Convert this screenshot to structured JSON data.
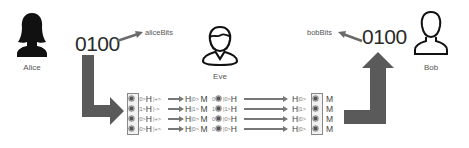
{
  "actors": {
    "alice": {
      "label": "Alice",
      "icon": "female-silhouette-filled-icon"
    },
    "eve": {
      "label": "Eve",
      "icon": "person-outline-icon"
    },
    "bob": {
      "label": "Bob",
      "icon": "person-outline-icon"
    }
  },
  "alice_bits": {
    "value": "0100",
    "label": "aliceBits"
  },
  "bob_bits": {
    "value": "0100",
    "label": "bobBits"
  },
  "colors": {
    "arrow": "#5a5a5a",
    "text": "#333333",
    "box_border": "#888888"
  },
  "circuit": {
    "rows": [
      {
        "alice_ket": "|0>",
        "alice_gate": "H",
        "state": "|+>",
        "eve_gate": "H",
        "eve_ket": "|0>",
        "eve_measure": "M",
        "eve_bit": "0",
        "resend_ket": "|0>",
        "resend_gate": "H",
        "bob_gate": "H",
        "bob_ket": "|0>",
        "bob_measure": "M"
      },
      {
        "alice_ket": "|1>",
        "alice_gate": "H",
        "state": "|->",
        "eve_gate": "H",
        "eve_ket": "|1>",
        "eve_measure": "M",
        "eve_bit": "1",
        "resend_ket": "|1>",
        "resend_gate": "H",
        "bob_gate": "H",
        "bob_ket": "|1>",
        "bob_measure": "M"
      },
      {
        "alice_ket": "|0>",
        "alice_gate": "H",
        "state": "|+>",
        "eve_gate": "H",
        "eve_ket": "|0>",
        "eve_measure": "M",
        "eve_bit": "0",
        "resend_ket": "|0>",
        "resend_gate": "H",
        "bob_gate": "H",
        "bob_ket": "|0>",
        "bob_measure": "M"
      },
      {
        "alice_ket": "|0>",
        "alice_gate": "H",
        "state": "|+>",
        "eve_gate": "H",
        "eve_ket": "|0>",
        "eve_measure": "M",
        "eve_bit": "0",
        "resend_ket": "|0>",
        "resend_gate": "H",
        "bob_gate": "H",
        "bob_ket": "|0>",
        "bob_measure": "M"
      }
    ]
  }
}
